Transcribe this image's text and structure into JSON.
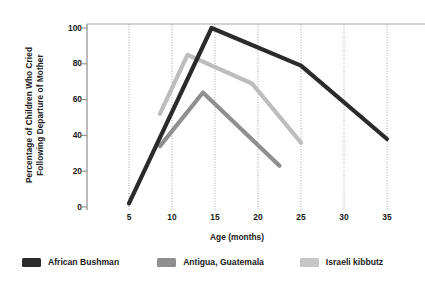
{
  "chart_data": {
    "type": "line",
    "title": "",
    "xlabel": "Age (months)",
    "ylabel": "Percentage of Children Who Cried Following Departure of Mother",
    "ylabel_line1": "Percentage of Children Who Cried",
    "ylabel_line2": "Following Departure of Mother",
    "xlim": [
      3.5,
      37
    ],
    "ylim": [
      0,
      105
    ],
    "xticks": [
      5,
      10,
      15,
      20,
      25,
      30,
      35
    ],
    "yticks": [
      0,
      20,
      40,
      60,
      80,
      100
    ],
    "grid": "vertical-dotted",
    "legend_position": "bottom",
    "series": [
      {
        "name": "African Bushman",
        "color": "#2b2b2b",
        "points": [
          {
            "x": 5,
            "y": 2
          },
          {
            "x": 14.6,
            "y": 100
          },
          {
            "x": 25,
            "y": 79
          },
          {
            "x": 35,
            "y": 38
          }
        ]
      },
      {
        "name": "Antigua, Guatemala",
        "color": "#8f8f8f",
        "points": [
          {
            "x": 8.6,
            "y": 34
          },
          {
            "x": 13.6,
            "y": 64
          },
          {
            "x": 22.5,
            "y": 23
          }
        ]
      },
      {
        "name": "Israeli kibbutz",
        "color": "#bdbdbd",
        "points": [
          {
            "x": 8.6,
            "y": 52
          },
          {
            "x": 11.8,
            "y": 85
          },
          {
            "x": 19.3,
            "y": 69
          },
          {
            "x": 25,
            "y": 36
          }
        ]
      }
    ]
  },
  "axes": {
    "x_title": "Age (months)",
    "y_title_line1": "Percentage of Children Who Cried",
    "y_title_line2": "Following Departure of Mother",
    "x_tick_labels": [
      "5",
      "10",
      "15",
      "20",
      "25",
      "30",
      "35"
    ],
    "y_tick_labels": [
      "0",
      "20",
      "40",
      "60",
      "80",
      "100"
    ]
  },
  "legend": {
    "items": [
      {
        "label": "African Bushman",
        "color": "#2b2b2b"
      },
      {
        "label": "Antigua, Guatemala",
        "color": "#8f8f8f"
      },
      {
        "label": "Israeli kibbutz",
        "color": "#c6c6c6"
      }
    ]
  },
  "colors": {
    "background": "#ffffff",
    "axis": "#8c8c8c",
    "gridline": "#9a9a9a",
    "text": "#1a1a1a"
  }
}
